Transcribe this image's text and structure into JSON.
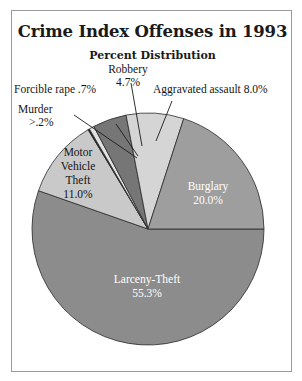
{
  "figure": {
    "title": "Crime Index Offenses in 1993",
    "subtitle": "Percent Distribution"
  },
  "callouts": {
    "robbery_name": "Robbery",
    "robbery_value": "4.7%",
    "forcible_rape": "Forcible rape .7%",
    "aggravated_assault": "Aggravated assault 8.0%",
    "murder_name": "Murder",
    "murder_value": ">.2%"
  },
  "inner_labels": {
    "motor_vehicle_theft": [
      "Motor",
      "Vehicle",
      "Theft",
      "11.0%"
    ],
    "burglary": [
      "Burglary",
      "20.0%"
    ],
    "larceny_theft": [
      "Larceny-Theft",
      "55.3%"
    ]
  },
  "chart_data": {
    "type": "pie",
    "title": "Crime Index Offenses in 1993",
    "subtitle": "Percent Distribution",
    "unit": "percent",
    "categories": [
      "Larceny-Theft",
      "Motor Vehicle Theft",
      "Murder",
      "Forcible rape",
      "Robbery",
      "Aggravated assault",
      "Burglary"
    ],
    "values": [
      55.3,
      11.0,
      0.2,
      0.7,
      4.7,
      8.0,
      20.0
    ],
    "value_labels": [
      "55.3%",
      "11.0%",
      ">.2%",
      ".7%",
      "4.7%",
      "8.0%",
      "20.0%"
    ],
    "colors": [
      "#8c8c8c",
      "#c9c9c9",
      "#1c1c1c",
      "#e2e2e2",
      "#767676",
      "#d5d5d5",
      "#9e9e9e"
    ],
    "label_placement": [
      "inside",
      "inside",
      "callout",
      "callout",
      "callout",
      "callout",
      "inside"
    ],
    "start_angle_deg": 0,
    "direction": "clockwise",
    "legend": "none",
    "grid": false,
    "center_px": [
      147,
      228
    ],
    "radius_px": 116
  }
}
